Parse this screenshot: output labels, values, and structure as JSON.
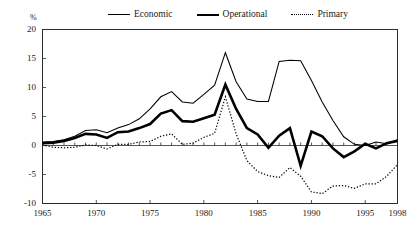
{
  "chart_data": {
    "type": "line",
    "title": "",
    "xlabel": "",
    "ylabel": "%",
    "ylim": [
      -10,
      20
    ],
    "xlim": [
      1965,
      1998
    ],
    "yticks": [
      20,
      15,
      10,
      5,
      0,
      -5,
      -10
    ],
    "ytick_labels": [
      "20",
      "15",
      "10",
      "5",
      "0",
      "-5",
      "-10"
    ],
    "xticks": [
      1965,
      1970,
      1975,
      1980,
      1985,
      1990,
      1995,
      1998
    ],
    "xtick_labels": [
      "1965",
      "1970",
      "1975",
      "1980",
      "1985",
      "1990",
      "1995",
      "1998"
    ],
    "grid": false,
    "legend_position": "top-center",
    "zero_line": true,
    "minor_xticks": "annual",
    "x": [
      1965,
      1966,
      1967,
      1968,
      1969,
      1970,
      1971,
      1972,
      1973,
      1974,
      1975,
      1976,
      1977,
      1978,
      1979,
      1980,
      1981,
      1982,
      1983,
      1984,
      1985,
      1986,
      1987,
      1988,
      1989,
      1990,
      1991,
      1992,
      1993,
      1994,
      1995,
      1996,
      1997,
      1998
    ],
    "series": [
      {
        "name": "Economic",
        "style": "thin-solid",
        "values": [
          0.6,
          0.7,
          1.0,
          1.6,
          2.6,
          2.7,
          2.2,
          3.0,
          3.6,
          4.6,
          6.3,
          8.4,
          9.3,
          7.5,
          7.3,
          8.8,
          10.4,
          16.0,
          11.0,
          8.0,
          7.6,
          7.6,
          14.5,
          14.7,
          14.6,
          11.2,
          7.5,
          4.3,
          1.5,
          0.2,
          0.0,
          0.6,
          0.3,
          1.0
        ]
      },
      {
        "name": "Operational",
        "style": "thick-solid",
        "values": [
          0.4,
          0.5,
          0.8,
          1.3,
          2.0,
          1.9,
          1.3,
          2.3,
          2.4,
          3.0,
          3.7,
          5.5,
          6.1,
          4.2,
          4.1,
          4.7,
          5.3,
          10.5,
          6.3,
          3.0,
          1.9,
          -0.4,
          1.7,
          3.0,
          -3.5,
          2.4,
          1.6,
          -0.5,
          -2.0,
          -1.0,
          0.3,
          -0.5,
          0.4,
          0.8
        ]
      },
      {
        "name": "Primary",
        "style": "dotted",
        "values": [
          0.1,
          -0.3,
          -0.4,
          -0.3,
          0.1,
          0.0,
          -0.6,
          0.2,
          0.2,
          0.6,
          0.7,
          1.6,
          2.0,
          0.2,
          0.4,
          1.4,
          2.1,
          8.4,
          2.0,
          -2.6,
          -4.5,
          -5.2,
          -5.5,
          -3.8,
          -5.3,
          -8.0,
          -8.3,
          -7.0,
          -6.9,
          -7.4,
          -6.6,
          -6.6,
          -5.3,
          -3.3
        ]
      }
    ]
  },
  "legend": {
    "entries": [
      {
        "label": "Economic",
        "style": "thin-solid"
      },
      {
        "label": "Operational",
        "style": "thick-solid"
      },
      {
        "label": "Primary",
        "style": "dotted"
      }
    ]
  },
  "axes": {
    "unit_label": "%"
  }
}
